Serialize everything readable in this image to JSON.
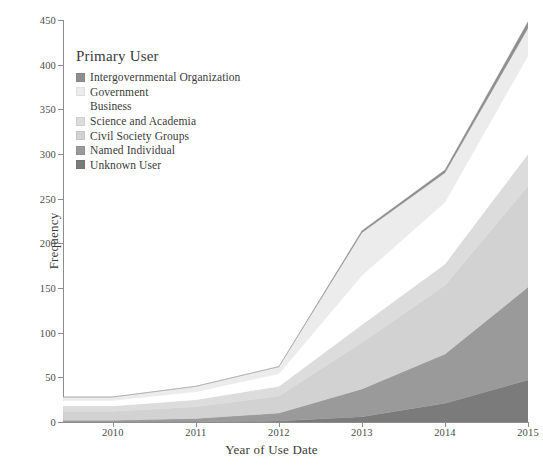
{
  "legend": {
    "title": "Primary User",
    "position": "inside-top-left",
    "items": [
      {
        "label": "Intergovernmental Organization",
        "color": "#8f8f8f"
      },
      {
        "label": "Government",
        "color": "#ececec"
      },
      {
        "label": "Business",
        "color": "#ffffff"
      },
      {
        "label": "Science and Academia",
        "color": "#dcdcdc"
      },
      {
        "label": "Civil Society Groups",
        "color": "#d2d2d2"
      },
      {
        "label": "Named Individual",
        "color": "#9a9a9a"
      },
      {
        "label": "Unknown User",
        "color": "#7b7b7b"
      }
    ]
  },
  "axes": {
    "x": {
      "label": "Year of Use Date",
      "ticks": [
        "2010",
        "2011",
        "2012",
        "2013",
        "2014",
        "2015"
      ],
      "min": 2009.4,
      "max": 2015.0
    },
    "y": {
      "label": "Frequency",
      "ticks": [
        "0",
        "50",
        "100",
        "150",
        "200",
        "250",
        "300",
        "350",
        "400",
        "450"
      ],
      "min": 0,
      "max": 450
    }
  },
  "chart_data": {
    "type": "area",
    "stacked": true,
    "title": "",
    "xlabel": "Year of Use Date",
    "ylabel": "Frequency",
    "xlim": [
      2009.4,
      2015.0
    ],
    "ylim": [
      0,
      450
    ],
    "grid": false,
    "legend_title": "Primary User",
    "legend_position": "inside-top-left",
    "x": [
      2009.4,
      2010,
      2011,
      2012,
      2013,
      2014,
      2015
    ],
    "series": [
      {
        "name": "Unknown User",
        "color": "#7b7b7b",
        "values": [
          0,
          0,
          0,
          1,
          6,
          21,
          47
        ]
      },
      {
        "name": "Named Individual",
        "color": "#9a9a9a",
        "values": [
          2,
          2,
          4,
          9,
          31,
          55,
          104
        ]
      },
      {
        "name": "Civil Society Groups",
        "color": "#d2d2d2",
        "values": [
          10,
          10,
          13,
          19,
          52,
          77,
          113
        ]
      },
      {
        "name": "Science and Academia",
        "color": "#dcdcdc",
        "values": [
          6,
          6,
          8,
          11,
          20,
          24,
          36
        ]
      },
      {
        "name": "Business",
        "color": "#ffffff",
        "values": [
          6,
          6,
          9,
          14,
          55,
          69,
          110
        ]
      },
      {
        "name": "Government",
        "color": "#ececec",
        "values": [
          4,
          4,
          6,
          8,
          48,
          33,
          31
        ]
      },
      {
        "name": "Intergovernmental Organization",
        "color": "#8f8f8f",
        "values": [
          0,
          0,
          0,
          0,
          2,
          3,
          7
        ]
      }
    ],
    "totals": [
      28,
      28,
      40,
      62,
      214,
      282,
      448
    ]
  }
}
